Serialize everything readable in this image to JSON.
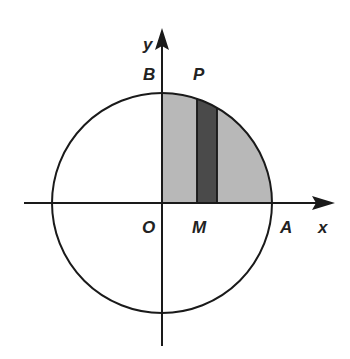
{
  "diagram": {
    "labels": {
      "y": "y",
      "x": "x",
      "B": "B",
      "P": "P",
      "O": "O",
      "M": "M",
      "A": "A"
    },
    "colors": {
      "stroke": "#1a1a1a",
      "quadrant_fill": "#b5b5b5",
      "strip_fill": "#4a4a4a"
    }
  }
}
